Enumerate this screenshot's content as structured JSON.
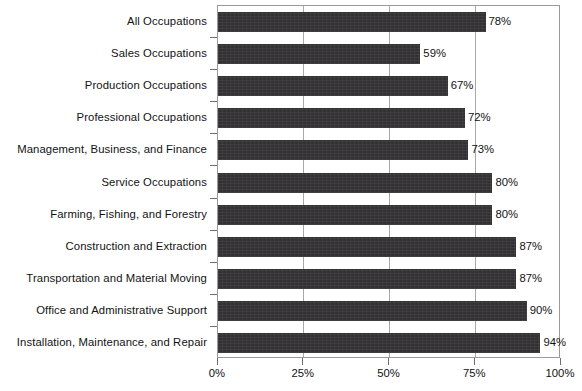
{
  "chart_data": {
    "type": "bar",
    "orientation": "horizontal",
    "title": "",
    "subtitle": "",
    "xlabel": "",
    "ylabel": "",
    "xlim": [
      0,
      100
    ],
    "xticks": [
      0,
      25,
      50,
      75,
      100
    ],
    "xtick_labels": [
      "0%",
      "25%",
      "50%",
      "75%",
      "100%"
    ],
    "grid": "vertical",
    "legend": "none",
    "bar_color": "#333133",
    "value_label_suffix": "%",
    "categories": [
      "All Occupations",
      "Sales Occupations",
      "Production Occupations",
      "Professional Occupations",
      "Management, Business, and Finance",
      "Service Occupations",
      "Farming, Fishing, and Forestry",
      "Construction and Extraction",
      "Transportation and Material Moving",
      "Office and Administrative Support",
      "Installation, Maintenance, and Repair"
    ],
    "values": [
      78,
      59,
      67,
      72,
      73,
      80,
      80,
      87,
      87,
      90,
      94
    ],
    "value_labels": [
      "78%",
      "59%",
      "67%",
      "72%",
      "73%",
      "80%",
      "80%",
      "87%",
      "87%",
      "90%",
      "94%"
    ]
  }
}
